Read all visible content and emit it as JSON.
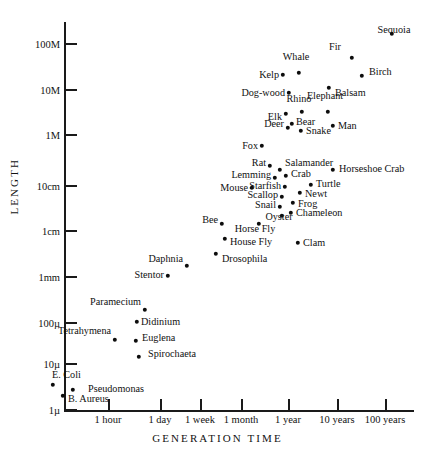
{
  "chart_data": {
    "type": "scatter",
    "title": "",
    "xlabel": "GENERATION TIME",
    "ylabel": "LENGTH",
    "grid": false,
    "legend": "none",
    "xticks": [
      "1 hour",
      "1 day",
      "1 week",
      "1 month",
      "1 year",
      "10 years",
      "100 years"
    ],
    "yticks": [
      "100M",
      "10M",
      "1M",
      "10cm",
      "1cm",
      "1mm",
      "100µ",
      "10µ",
      "1µ"
    ],
    "note": "Log-log plot of organism body length versus generation time. Axis ranges: length 1 micron to 100 meters; generation time under 1 hour to over 100 years.",
    "points": [
      {
        "name": "Sequoia",
        "x": 392,
        "y": 34,
        "lx": 394,
        "ly": 25,
        "anchor": "b"
      },
      {
        "name": "Fir",
        "x": 352,
        "y": 58,
        "lx": 341,
        "ly": 47,
        "anchor": "r"
      },
      {
        "name": "Birch",
        "x": 362,
        "y": 76,
        "lx": 369,
        "ly": 72,
        "anchor": "l"
      },
      {
        "name": "Whale",
        "x": 299,
        "y": 73,
        "lx": 296,
        "ly": 62,
        "anchor": "t"
      },
      {
        "name": "Kelp",
        "x": 283,
        "y": 75,
        "lx": 279,
        "ly": 75,
        "anchor": "r"
      },
      {
        "name": "Balsam",
        "x": 329,
        "y": 88,
        "lx": 335,
        "ly": 93,
        "anchor": "l"
      },
      {
        "name": "Dog-wood",
        "x": 289,
        "y": 93,
        "lx": 285,
        "ly": 93,
        "anchor": "r"
      },
      {
        "name": "Elephant",
        "x": 328,
        "y": 112,
        "lx": 325,
        "ly": 101,
        "anchor": "t"
      },
      {
        "name": "Rhino",
        "x": 302,
        "y": 112,
        "lx": 299,
        "ly": 104,
        "anchor": "t"
      },
      {
        "name": "Elk",
        "x": 286,
        "y": 114,
        "lx": 282,
        "ly": 117,
        "anchor": "r"
      },
      {
        "name": "Bear",
        "x": 292,
        "y": 124,
        "lx": 296,
        "ly": 122,
        "anchor": "l"
      },
      {
        "name": "Man",
        "x": 333,
        "y": 126,
        "lx": 338,
        "ly": 126,
        "anchor": "l"
      },
      {
        "name": "Deer",
        "x": 288,
        "y": 128,
        "lx": 284,
        "ly": 124,
        "anchor": "r"
      },
      {
        "name": "Snake",
        "x": 301,
        "y": 131,
        "lx": 306,
        "ly": 131,
        "anchor": "l"
      },
      {
        "name": "Fox",
        "x": 262,
        "y": 146,
        "lx": 258,
        "ly": 146,
        "anchor": "r"
      },
      {
        "name": "Rat",
        "x": 270,
        "y": 166,
        "lx": 266,
        "ly": 163,
        "anchor": "r"
      },
      {
        "name": "Salamander",
        "x": 280,
        "y": 170,
        "lx": 285,
        "ly": 163,
        "anchor": "l"
      },
      {
        "name": "Horseshoe Crab",
        "x": 333,
        "y": 170,
        "lx": 339,
        "ly": 169,
        "anchor": "l"
      },
      {
        "name": "Crab",
        "x": 286,
        "y": 176,
        "lx": 291,
        "ly": 174,
        "anchor": "l"
      },
      {
        "name": "Lemming",
        "x": 275,
        "y": 178,
        "lx": 271,
        "ly": 175,
        "anchor": "r"
      },
      {
        "name": "Turtle",
        "x": 311,
        "y": 185,
        "lx": 316,
        "ly": 184,
        "anchor": "l"
      },
      {
        "name": "Starfish",
        "x": 285,
        "y": 187,
        "lx": 281,
        "ly": 186,
        "anchor": "r"
      },
      {
        "name": "Mouse",
        "x": 252,
        "y": 188,
        "lx": 248,
        "ly": 188,
        "anchor": "r"
      },
      {
        "name": "Newt",
        "x": 300,
        "y": 193,
        "lx": 305,
        "ly": 194,
        "anchor": "l"
      },
      {
        "name": "Scallop",
        "x": 282,
        "y": 197,
        "lx": 278,
        "ly": 195,
        "anchor": "r"
      },
      {
        "name": "Frog",
        "x": 293,
        "y": 203,
        "lx": 298,
        "ly": 204,
        "anchor": "l"
      },
      {
        "name": "Snail",
        "x": 280,
        "y": 207,
        "lx": 276,
        "ly": 205,
        "anchor": "r"
      },
      {
        "name": "Chameleon",
        "x": 291,
        "y": 213,
        "lx": 296,
        "ly": 213,
        "anchor": "l"
      },
      {
        "name": "Oyster",
        "x": 282,
        "y": 216,
        "lx": 279,
        "ly": 222,
        "anchor": "t"
      },
      {
        "name": "Bee",
        "x": 222,
        "y": 224,
        "lx": 218,
        "ly": 220,
        "anchor": "r"
      },
      {
        "name": "Horse Fly",
        "x": 259,
        "y": 224,
        "lx": 255,
        "ly": 234,
        "anchor": "t"
      },
      {
        "name": "House Fly",
        "x": 225,
        "y": 239,
        "lx": 230,
        "ly": 242,
        "anchor": "l"
      },
      {
        "name": "Clam",
        "x": 298,
        "y": 243,
        "lx": 303,
        "ly": 243,
        "anchor": "l"
      },
      {
        "name": "Drosophila",
        "x": 216,
        "y": 254,
        "lx": 222,
        "ly": 259,
        "anchor": "l"
      },
      {
        "name": "Daphnia",
        "x": 187,
        "y": 266,
        "lx": 183,
        "ly": 259,
        "anchor": "r"
      },
      {
        "name": "Stentor",
        "x": 168,
        "y": 276,
        "lx": 164,
        "ly": 275,
        "anchor": "r"
      },
      {
        "name": "Paramecium",
        "x": 145,
        "y": 310,
        "lx": 141,
        "ly": 302,
        "anchor": "r"
      },
      {
        "name": "Didinium",
        "x": 137,
        "y": 322,
        "lx": 141,
        "ly": 322,
        "anchor": "l"
      },
      {
        "name": "Tetrahymena",
        "x": 115,
        "y": 340,
        "lx": 111,
        "ly": 331,
        "anchor": "r"
      },
      {
        "name": "Euglena",
        "x": 136,
        "y": 341,
        "lx": 142,
        "ly": 338,
        "anchor": "l"
      },
      {
        "name": "Spirochaeta",
        "x": 139,
        "y": 357,
        "lx": 148,
        "ly": 354,
        "anchor": "l"
      },
      {
        "name": "E. Coli",
        "x": 53,
        "y": 385,
        "lx": 52,
        "ly": 375,
        "anchor": "l"
      },
      {
        "name": "Pseudomonas",
        "x": 73,
        "y": 390,
        "lx": 88,
        "ly": 389,
        "anchor": "l"
      },
      {
        "name": "B. Aureus",
        "x": 63,
        "y": 396,
        "lx": 68,
        "ly": 399,
        "anchor": "l"
      }
    ],
    "xtick_positions": [
      108,
      160,
      200,
      241,
      288,
      337,
      385
    ],
    "ytick_positions": [
      44,
      90,
      135,
      186,
      231,
      277,
      323,
      364,
      410
    ]
  }
}
